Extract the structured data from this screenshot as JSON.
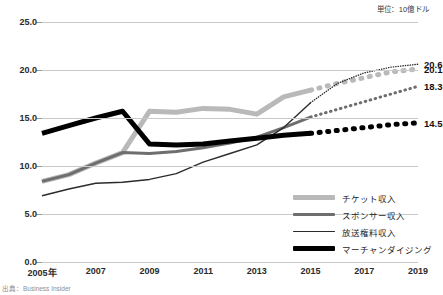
{
  "unit_note": "単位：10億ドル",
  "source_note": "出典：Business Insider",
  "colors": {
    "ticket": "#b9b9b9",
    "sponsor": "#6e6e6e",
    "broadcast": "#2b2b2b",
    "merchandising": "#000000",
    "gridline": "#c9c9c9",
    "axis_text": "#2b2b2b"
  },
  "legend": {
    "position": "bottom-right",
    "items": [
      {
        "label": "チケット収入",
        "color": "#b9b9b9",
        "width": 5
      },
      {
        "label": "スポンサー収入",
        "color": "#6e6e6e",
        "width": 3
      },
      {
        "label": "放送権料収入",
        "color": "#2b2b2b",
        "width": 1.4
      },
      {
        "label": "マーチャンダイジング",
        "color": "#000000",
        "width": 5
      }
    ]
  },
  "end_labels": [
    {
      "value": "20.6",
      "series": "放送権料収入"
    },
    {
      "value": "20.1",
      "series": "チケット収入"
    },
    {
      "value": "18.3",
      "series": "スポンサー収入"
    },
    {
      "value": "14.5",
      "series": "マーチャンダイジング"
    }
  ],
  "chart_data": {
    "type": "line",
    "title": "",
    "subtitle": "",
    "xlabel": "",
    "ylabel": "",
    "unit": "単位：10億ドル",
    "source": "出典：Business Insider",
    "grid": true,
    "legend_position": "bottom-right",
    "ylim": [
      0.0,
      25.0
    ],
    "yticks": [
      0.0,
      5.0,
      10.0,
      15.0,
      20.0,
      25.0
    ],
    "ytick_labels": [
      "0.0",
      "5.0",
      "10.0",
      "15.0",
      "20.0",
      "25.0"
    ],
    "xlim": [
      2005,
      2019
    ],
    "xticks": [
      2005,
      2007,
      2009,
      2011,
      2013,
      2015,
      2017,
      2019
    ],
    "xtick_labels": [
      "2005年",
      "2007",
      "2009",
      "2011",
      "2013",
      "2015",
      "2017",
      "2019"
    ],
    "x": [
      2005,
      2006,
      2007,
      2008,
      2009,
      2010,
      2011,
      2012,
      2013,
      2014,
      2015,
      2016,
      2017,
      2018,
      2019
    ],
    "forecast_start": 2015,
    "series": [
      {
        "name": "チケット収入",
        "color": "#b9b9b9",
        "width": 5,
        "values": [
          8.4,
          9.1,
          10.3,
          11.4,
          15.7,
          15.6,
          16.0,
          15.9,
          15.4,
          17.2,
          17.9,
          18.6,
          19.2,
          19.8,
          20.1
        ],
        "end_label": "20.1"
      },
      {
        "name": "スポンサー収入",
        "color": "#6e6e6e",
        "width": 3,
        "values": [
          8.4,
          9.1,
          10.3,
          11.4,
          11.3,
          11.5,
          11.9,
          12.4,
          13.0,
          14.0,
          15.1,
          15.9,
          16.7,
          17.5,
          18.3
        ],
        "end_label": "18.3"
      },
      {
        "name": "放送権料収入",
        "color": "#2b2b2b",
        "width": 1.4,
        "values": [
          6.9,
          7.6,
          8.2,
          8.3,
          8.6,
          9.2,
          10.4,
          11.3,
          12.2,
          14.0,
          16.6,
          18.6,
          19.7,
          20.3,
          20.6
        ],
        "end_label": "20.6"
      },
      {
        "name": "マーチャンダイジング",
        "color": "#000000",
        "width": 5,
        "values": [
          13.4,
          14.2,
          15.0,
          15.7,
          12.3,
          12.2,
          12.3,
          12.6,
          12.9,
          13.2,
          13.4,
          13.7,
          14.0,
          14.3,
          14.5
        ],
        "end_label": "14.5"
      }
    ]
  }
}
